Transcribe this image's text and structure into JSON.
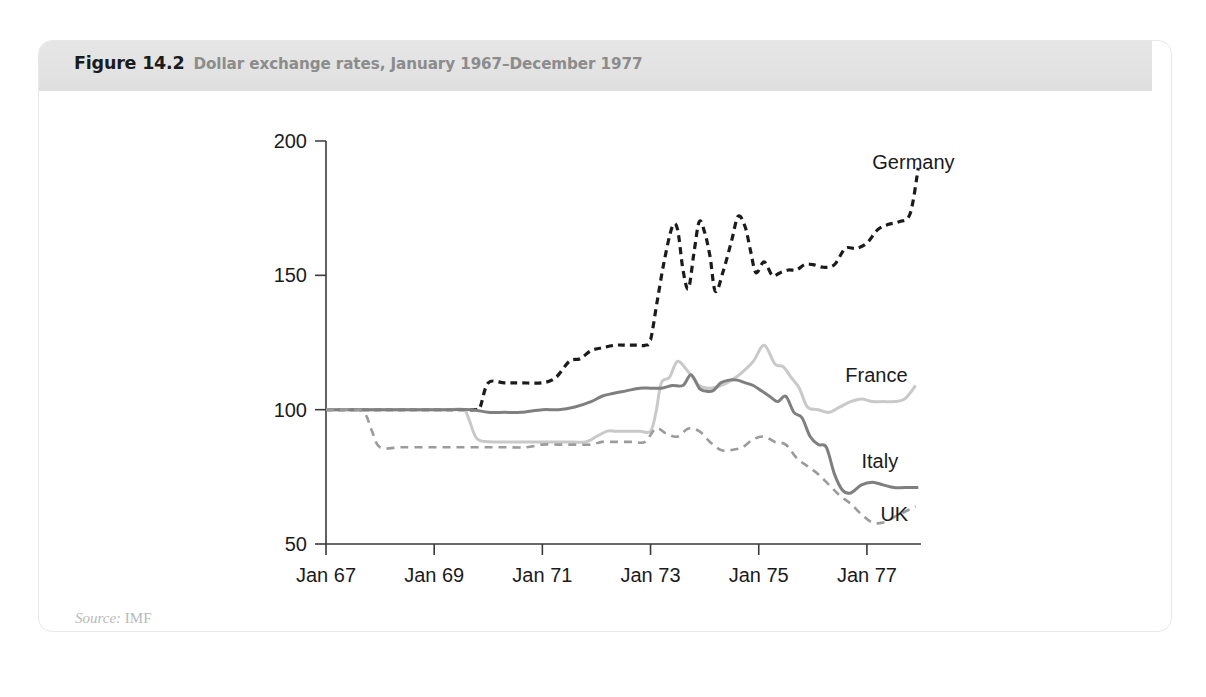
{
  "figure": {
    "number": "Figure 14.2",
    "title": "Dollar exchange rates, January 1967–December 1977",
    "source_prefix": "Source:",
    "source_value": "IMF"
  },
  "chart_data": {
    "type": "line",
    "title": "Dollar exchange rates, January 1967–December 1977",
    "xlabel": "",
    "ylabel": "",
    "xlim": [
      1967.0,
      1978.0
    ],
    "ylim": [
      50,
      200
    ],
    "yticks": [
      50,
      100,
      150,
      200
    ],
    "ytick_labels": [
      "50",
      "100",
      "150",
      "200"
    ],
    "xticks": [
      1967,
      1969,
      1971,
      1973,
      1975,
      1977
    ],
    "xtick_labels": [
      "Jan 67",
      "Jan 69",
      "Jan 71",
      "Jan 73",
      "Jan 75",
      "Jan 77"
    ],
    "grid": false,
    "legend_position": "inline-right-labels",
    "index_base": "January 1967 = 100",
    "series": [
      {
        "name": "Germany",
        "color": "#1b1b1b",
        "style": "dashed",
        "width": 3.2,
        "dash": "7,5",
        "label_x": 1977.1,
        "label_y": 192,
        "x": [
          1967.0,
          1967.5,
          1968.0,
          1968.5,
          1969.0,
          1969.4,
          1969.75,
          1969.85,
          1970.0,
          1970.3,
          1970.6,
          1971.0,
          1971.25,
          1971.5,
          1971.7,
          1971.9,
          1972.1,
          1972.35,
          1972.55,
          1972.75,
          1972.9,
          1973.0,
          1973.12,
          1973.25,
          1973.4,
          1973.5,
          1973.6,
          1973.7,
          1973.8,
          1973.9,
          1974.0,
          1974.1,
          1974.2,
          1974.35,
          1974.5,
          1974.62,
          1974.75,
          1974.85,
          1974.95,
          1975.1,
          1975.25,
          1975.4,
          1975.55,
          1975.7,
          1975.85,
          1976.0,
          1976.2,
          1976.4,
          1976.6,
          1976.8,
          1977.0,
          1977.2,
          1977.4,
          1977.6,
          1977.8,
          1977.95
        ],
        "y": [
          100,
          100,
          100,
          100,
          100,
          100,
          100,
          101,
          110,
          110,
          110,
          110,
          112,
          118,
          119,
          122,
          123,
          124,
          124,
          124,
          124,
          126,
          140,
          155,
          168,
          167,
          152,
          145,
          158,
          170,
          166,
          157,
          144,
          152,
          163,
          172,
          168,
          159,
          151,
          155,
          150,
          151,
          152,
          152,
          154,
          154,
          153,
          154,
          160,
          160,
          162,
          167,
          169,
          170,
          173,
          190
        ]
      },
      {
        "name": "France",
        "color": "#c9c9c9",
        "style": "solid",
        "width": 3.0,
        "dash": "",
        "label_x": 1976.6,
        "label_y": 113,
        "x": [
          1967.0,
          1967.5,
          1968.0,
          1968.5,
          1969.0,
          1969.3,
          1969.55,
          1969.65,
          1969.8,
          1970.1,
          1970.5,
          1971.0,
          1971.4,
          1971.8,
          1972.0,
          1972.2,
          1972.35,
          1972.5,
          1972.8,
          1973.0,
          1973.1,
          1973.2,
          1973.35,
          1973.5,
          1973.7,
          1973.9,
          1974.1,
          1974.3,
          1974.5,
          1974.7,
          1974.9,
          1975.1,
          1975.3,
          1975.45,
          1975.6,
          1975.75,
          1975.9,
          1976.1,
          1976.3,
          1976.5,
          1976.7,
          1976.9,
          1977.1,
          1977.3,
          1977.5,
          1977.7,
          1977.9
        ],
        "y": [
          100,
          100,
          100,
          100,
          100,
          100,
          100,
          96,
          89,
          88,
          88,
          88,
          88,
          88,
          90,
          92,
          92,
          92,
          92,
          92,
          99,
          110,
          112,
          118,
          114,
          109,
          108,
          109,
          111,
          114,
          118,
          124,
          117,
          116,
          112,
          108,
          101,
          100,
          99,
          101,
          103,
          104,
          103,
          103,
          103,
          104,
          109
        ]
      },
      {
        "name": "Italy",
        "color": "#7f7f7f",
        "style": "solid",
        "width": 3.0,
        "dash": "",
        "label_x": 1976.9,
        "label_y": 81,
        "x": [
          1967.0,
          1967.6,
          1968.2,
          1968.8,
          1969.3,
          1969.7,
          1970.0,
          1970.3,
          1970.6,
          1971.0,
          1971.3,
          1971.6,
          1971.9,
          1972.1,
          1972.3,
          1972.55,
          1972.8,
          1973.0,
          1973.2,
          1973.4,
          1973.6,
          1973.75,
          1973.9,
          1974.0,
          1974.15,
          1974.3,
          1974.45,
          1974.6,
          1974.75,
          1974.9,
          1975.05,
          1975.2,
          1975.35,
          1975.5,
          1975.65,
          1975.8,
          1975.95,
          1976.1,
          1976.25,
          1976.4,
          1976.55,
          1976.7,
          1976.9,
          1977.1,
          1977.3,
          1977.5,
          1977.7,
          1977.95
        ],
        "y": [
          100,
          100,
          100,
          100,
          100,
          100,
          99,
          99,
          99,
          100,
          100,
          101,
          103,
          105,
          106,
          107,
          108,
          108,
          108,
          109,
          109,
          113,
          108,
          107,
          107,
          110,
          111,
          111,
          110,
          109,
          107,
          105,
          103,
          105,
          99,
          97,
          90,
          87,
          86,
          76,
          70,
          69,
          72,
          73,
          72,
          71,
          71,
          71
        ]
      },
      {
        "name": "UK",
        "color": "#9b9b9b",
        "style": "dashed",
        "width": 2.6,
        "dash": "8,6",
        "label_x": 1977.25,
        "label_y": 61,
        "x": [
          1967.0,
          1967.4,
          1967.7,
          1967.85,
          1968.0,
          1968.4,
          1968.9,
          1969.4,
          1969.9,
          1970.3,
          1970.7,
          1971.0,
          1971.3,
          1971.6,
          1971.9,
          1972.1,
          1972.3,
          1972.5,
          1972.7,
          1972.9,
          1973.1,
          1973.3,
          1973.5,
          1973.7,
          1973.9,
          1974.1,
          1974.3,
          1974.5,
          1974.7,
          1974.9,
          1975.1,
          1975.3,
          1975.5,
          1975.7,
          1975.9,
          1976.1,
          1976.3,
          1976.5,
          1976.7,
          1976.9,
          1977.1,
          1977.3,
          1977.5,
          1977.7,
          1977.9
        ],
        "y": [
          100,
          100,
          99,
          92,
          86,
          86,
          86,
          86,
          86,
          86,
          86,
          87,
          87,
          87,
          87,
          88,
          88,
          88,
          88,
          88,
          93,
          91,
          90,
          93,
          92,
          88,
          85,
          85,
          86,
          89,
          90,
          88,
          87,
          82,
          79,
          76,
          72,
          68,
          65,
          61,
          58,
          58,
          60,
          62,
          64
        ]
      }
    ]
  }
}
